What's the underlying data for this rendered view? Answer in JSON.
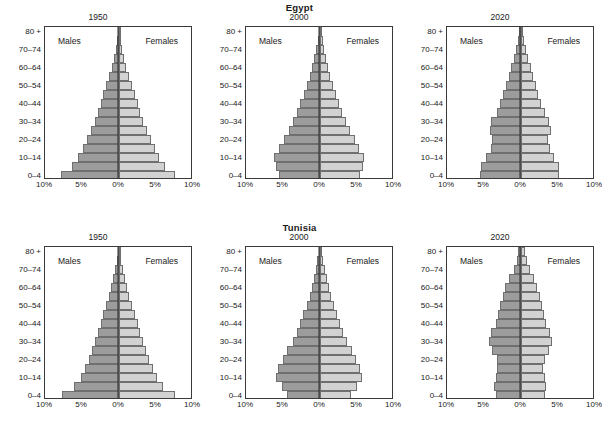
{
  "figure": {
    "series_labels": {
      "males": "Males",
      "females": "Females"
    },
    "age_groups": [
      "0–4",
      "5–9",
      "10–14",
      "15–19",
      "20–24",
      "25–29",
      "30–34",
      "35–39",
      "40–44",
      "45–49",
      "50–54",
      "55–59",
      "60–64",
      "65–69",
      "70–74",
      "75–79",
      "80 +"
    ],
    "y_tick_labels": [
      "0–4",
      "10–14",
      "20–24",
      "30–34",
      "40–44",
      "50–54",
      "60–64",
      "70–74",
      "80 +"
    ],
    "x_tick_labels": [
      "10%",
      "5%",
      "0%",
      "5%",
      "10%"
    ],
    "colors": {
      "male_fill": "#9c9c9c",
      "female_fill": "#d2d2d2",
      "bar_border": "#6f6f6f",
      "frame": "#3a3a3a",
      "center_axis": "#2a2a2a"
    }
  },
  "chart_data": {
    "type": "bar",
    "subtype": "population-pyramid",
    "title": "",
    "xlabel": "",
    "ylabel": "",
    "xlim": [
      -10,
      10
    ],
    "x_ticks": [
      -10,
      -5,
      0,
      5,
      10
    ],
    "x_tick_labels": [
      "10%",
      "5%",
      "0%",
      "5%",
      "10%"
    ],
    "grid": false,
    "legend": [
      "Males",
      "Females"
    ],
    "legend_position": "inside-top-left-and-top-right",
    "units": "percent of total population",
    "categories": [
      "0–4",
      "5–9",
      "10–14",
      "15–19",
      "20–24",
      "25–29",
      "30–34",
      "35–39",
      "40–44",
      "45–49",
      "50–54",
      "55–59",
      "60–64",
      "65–69",
      "70–74",
      "75–79",
      "80 +"
    ],
    "panels": [
      {
        "country": "Egypt",
        "year": "1950",
        "series": [
          {
            "name": "Males",
            "side": "left",
            "values": [
              7.8,
              6.3,
              5.5,
              4.9,
              4.3,
              3.8,
              3.3,
              2.9,
              2.5,
              2.1,
              1.7,
              1.35,
              1.0,
              0.7,
              0.45,
              0.25,
              0.15
            ]
          },
          {
            "name": "Females",
            "side": "right",
            "values": [
              7.6,
              6.2,
              5.4,
              4.8,
              4.3,
              3.8,
              3.3,
              2.9,
              2.5,
              2.1,
              1.7,
              1.35,
              1.0,
              0.7,
              0.45,
              0.25,
              0.15
            ]
          }
        ]
      },
      {
        "country": "Egypt",
        "year": "2000",
        "series": [
          {
            "name": "Males",
            "side": "left",
            "values": [
              5.6,
              6.0,
              6.2,
              5.5,
              4.8,
              4.2,
              3.6,
              3.1,
              2.7,
              2.2,
              1.8,
              1.4,
              1.1,
              0.8,
              0.55,
              0.3,
              0.2
            ]
          },
          {
            "name": "Females",
            "side": "right",
            "values": [
              5.4,
              5.8,
              6.0,
              5.3,
              4.7,
              4.1,
              3.5,
              3.0,
              2.6,
              2.2,
              1.8,
              1.4,
              1.1,
              0.8,
              0.6,
              0.35,
              0.25
            ]
          }
        ]
      },
      {
        "country": "Egypt",
        "year": "2020",
        "series": [
          {
            "name": "Males",
            "side": "left",
            "values": [
              5.5,
              5.4,
              4.7,
              4.1,
              3.9,
              4.2,
              4.0,
              3.3,
              2.8,
              2.4,
              2.0,
              1.6,
              1.3,
              0.95,
              0.65,
              0.35,
              0.25
            ]
          },
          {
            "name": "Females",
            "side": "right",
            "values": [
              5.2,
              5.1,
              4.5,
              3.9,
              3.7,
              4.0,
              3.8,
              3.2,
              2.7,
              2.3,
              2.0,
              1.6,
              1.3,
              1.0,
              0.7,
              0.4,
              0.3
            ]
          }
        ]
      },
      {
        "country": "Tunisia",
        "year": "1950",
        "series": [
          {
            "name": "Males",
            "side": "left",
            "values": [
              7.7,
              6.1,
              5.2,
              4.6,
              4.1,
              3.7,
              3.3,
              2.9,
              2.5,
              2.1,
              1.75,
              1.4,
              1.05,
              0.75,
              0.5,
              0.3,
              0.2
            ]
          },
          {
            "name": "Females",
            "side": "right",
            "values": [
              7.5,
              6.0,
              5.1,
              4.6,
              4.1,
              3.7,
              3.3,
              2.9,
              2.5,
              2.1,
              1.75,
              1.4,
              1.05,
              0.75,
              0.5,
              0.3,
              0.2
            ]
          }
        ]
      },
      {
        "country": "Tunisia",
        "year": "2000",
        "series": [
          {
            "name": "Males",
            "side": "left",
            "values": [
              4.4,
              5.2,
              6.0,
              5.7,
              5.0,
              4.4,
              3.7,
              3.1,
              2.7,
              2.3,
              1.8,
              1.4,
              1.1,
              0.85,
              0.6,
              0.35,
              0.2
            ]
          },
          {
            "name": "Females",
            "side": "right",
            "values": [
              4.2,
              5.0,
              5.7,
              5.4,
              4.8,
              4.3,
              3.6,
              3.1,
              2.7,
              2.3,
              1.85,
              1.45,
              1.15,
              0.9,
              0.65,
              0.4,
              0.25
            ]
          }
        ]
      },
      {
        "country": "Tunisia",
        "year": "2020",
        "series": [
          {
            "name": "Males",
            "side": "left",
            "values": [
              3.4,
              3.6,
              3.4,
              3.2,
              3.3,
              3.9,
              4.3,
              4.0,
              3.4,
              3.1,
              2.9,
              2.5,
              2.1,
              1.6,
              1.0,
              0.6,
              0.4
            ]
          },
          {
            "name": "Females",
            "side": "right",
            "values": [
              3.2,
              3.4,
              3.2,
              3.0,
              3.2,
              3.8,
              4.2,
              3.9,
              3.4,
              3.1,
              2.9,
              2.5,
              2.2,
              1.7,
              1.2,
              0.75,
              0.55
            ]
          }
        ]
      }
    ]
  }
}
